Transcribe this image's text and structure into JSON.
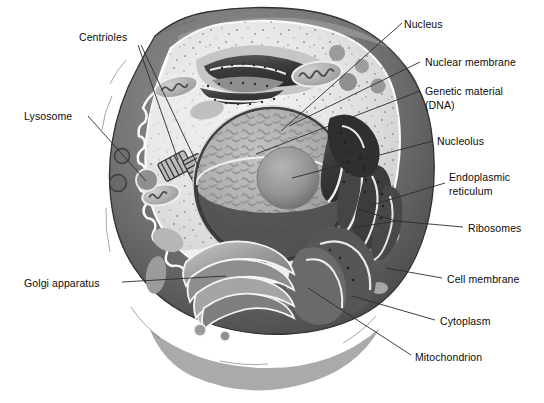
{
  "figure": {
    "background_color": "#ffffff",
    "text_color": "#0c0c0c",
    "leader_line_color": "#2b2b2b"
  },
  "palette": {
    "cell_membrane_dark": "#6e6e6e",
    "cell_membrane_shadow": "#4f4f4f",
    "cell_membrane_highlight": "#9a9a9a",
    "cytoplasm_light": "#e9e9e9",
    "cytoplasm_mid": "#d6d6d6",
    "cytoplasm_pale": "#f4f4f4",
    "nucleus_rim": "#4a4a4a",
    "nucleus_interior": "#b0b0b0",
    "nucleolus": "#8e8e8e",
    "er_dark": "#3a3a3a",
    "er_mid": "#616161",
    "golgi_mid": "#9d9d9d",
    "golgi_dark": "#737373",
    "mitochondria": "#aeaeae",
    "vesicle_dark": "#8a8a8a",
    "ribosome_dot": "#666666"
  },
  "labels": [
    {
      "id": "centrioles",
      "text": "Centrioles",
      "x": 79,
      "y": 31,
      "side": "left"
    },
    {
      "id": "lysosome",
      "text": "Lysosome",
      "x": 24,
      "y": 110,
      "side": "left"
    },
    {
      "id": "golgi-apparatus",
      "text": "Golgi apparatus",
      "x": 24,
      "y": 277,
      "side": "left"
    },
    {
      "id": "nucleus",
      "text": "Nucleus",
      "x": 404,
      "y": 18,
      "side": "right"
    },
    {
      "id": "nuclear-membrane",
      "text": "Nuclear membrane",
      "x": 425,
      "y": 56,
      "side": "right"
    },
    {
      "id": "genetic-material",
      "text": "Genetic material",
      "x": 425,
      "y": 85,
      "side": "right"
    },
    {
      "id": "genetic-material-2",
      "text": "(DNA)",
      "x": 425,
      "y": 99,
      "side": "right"
    },
    {
      "id": "nucleolus",
      "text": "Nucleolus",
      "x": 437,
      "y": 135,
      "side": "right"
    },
    {
      "id": "endoplasmic",
      "text": "Endoplasmic",
      "x": 449,
      "y": 171,
      "side": "right"
    },
    {
      "id": "endoplasmic-2",
      "text": "reticulum",
      "x": 449,
      "y": 185,
      "side": "right"
    },
    {
      "id": "ribosomes",
      "text": "Ribosomes",
      "x": 468,
      "y": 222,
      "side": "right"
    },
    {
      "id": "cell-membrane",
      "text": "Cell membrane",
      "x": 447,
      "y": 273,
      "side": "right"
    },
    {
      "id": "cytoplasm",
      "text": "Cytoplasm",
      "x": 440,
      "y": 315,
      "side": "right"
    },
    {
      "id": "mitochondrion",
      "text": "Mitochondrion",
      "x": 415,
      "y": 351,
      "side": "right"
    }
  ],
  "structures": [
    {
      "id": "cell-membrane",
      "name": "Cell membrane",
      "description": "thick irregular outer dark-gray band enclosing the cell"
    },
    {
      "id": "cytoplasm",
      "name": "Cytoplasm",
      "description": "pale speckled ground substance filling the cell interior"
    },
    {
      "id": "nucleus",
      "name": "Nucleus",
      "description": "large cut-away sphere, centre-right of cell"
    },
    {
      "id": "nuclear-membrane",
      "name": "Nuclear membrane",
      "description": "dark rim bounding the nucleus"
    },
    {
      "id": "genetic-material",
      "name": "Genetic material (DNA)",
      "description": "mottled chromatin texture inside the nucleus"
    },
    {
      "id": "nucleolus",
      "name": "Nucleolus",
      "description": "dense shaded sphere within the nucleus"
    },
    {
      "id": "endoplasmic-reticulum",
      "name": "Endoplasmic reticulum",
      "description": "dark ruffled stacked membranes right of nucleus and at top of cell"
    },
    {
      "id": "ribosomes",
      "name": "Ribosomes",
      "description": "fine dark dots scattered in cytoplasm and studding the ER"
    },
    {
      "id": "golgi-apparatus",
      "name": "Golgi apparatus",
      "description": "stack of curved flattened cisternae at lower-left of nucleus"
    },
    {
      "id": "mitochondrion",
      "name": "Mitochondrion",
      "description": "oval organelles with internal cristae"
    },
    {
      "id": "centrioles",
      "name": "Centrioles",
      "description": "pair of short striped cylinders at right angles, left of nucleus"
    },
    {
      "id": "lysosome",
      "name": "Lysosome",
      "description": "small dark round vesicles near the cell membrane"
    }
  ]
}
